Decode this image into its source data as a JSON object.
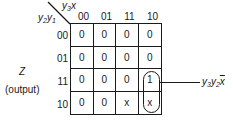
{
  "kmap": {
    "column_variable": "y3x",
    "row_variable": "y2y1",
    "column_headers": [
      "00",
      "01",
      "11",
      "10"
    ],
    "row_headers": [
      "00",
      "01",
      "11",
      "10"
    ],
    "cells": [
      [
        "0",
        "0",
        "0",
        "0"
      ],
      [
        "0",
        "0",
        "0",
        "0"
      ],
      [
        "0",
        "0",
        "0",
        "1"
      ],
      [
        "0",
        "0",
        "x",
        "x"
      ]
    ]
  },
  "labels": {
    "col_var_y": "y",
    "col_var_sub": "3",
    "col_var_x": "x",
    "row_var_y1": "y",
    "row_var_sub1": "2",
    "row_var_y2": "y",
    "row_var_sub2": "1",
    "output_name": "Z",
    "output_caption": "(output)"
  },
  "grouping": {
    "term_y1": "y",
    "term_sub1": "3",
    "term_y2": "y",
    "term_sub2": "2",
    "term_xbar": "x",
    "covered_cells": [
      "row 11 col 10",
      "row 10 col 10"
    ]
  }
}
